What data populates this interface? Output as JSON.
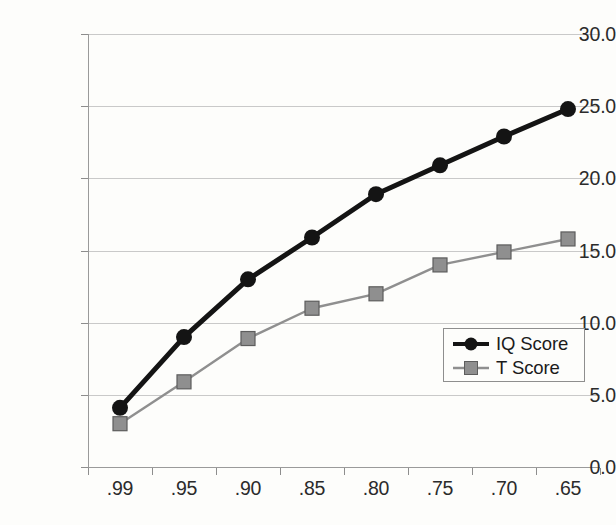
{
  "chart_data": {
    "type": "line",
    "title": "",
    "subtitle": "",
    "xlabel": "",
    "ylabel": "",
    "categories": [
      ".99",
      ".95",
      ".90",
      ".85",
      ".80",
      ".75",
      ".70",
      ".65"
    ],
    "series": [
      {
        "name": "IQ Score",
        "marker": "circle",
        "color": "#141414",
        "values": [
          4.1,
          9.0,
          13.0,
          15.9,
          18.9,
          20.9,
          22.9,
          24.8
        ]
      },
      {
        "name": "T Score",
        "marker": "square",
        "color": "#8f8f8f",
        "values": [
          3.0,
          5.9,
          8.9,
          11.0,
          12.0,
          14.0,
          14.9,
          15.8
        ]
      }
    ],
    "ylim": [
      0.0,
      30.0
    ],
    "ytick_labels": [
      "0.0",
      "5.0",
      "10.0",
      "15.0",
      "20.0",
      "25.0",
      "30.0"
    ],
    "ytick_values": [
      0.0,
      5.0,
      10.0,
      15.0,
      20.0,
      25.0,
      30.0
    ],
    "grid": true,
    "legend_position": "bottom-right",
    "legend_entries": [
      "IQ Score",
      "T Score"
    ],
    "colors": {
      "background": "#fdfdfb",
      "gridline": "#c9c9c9",
      "axis": "#9a9a9a",
      "text": "#2b2b2b",
      "series_1": "#141414",
      "series_2": "#8f8f8f"
    }
  }
}
